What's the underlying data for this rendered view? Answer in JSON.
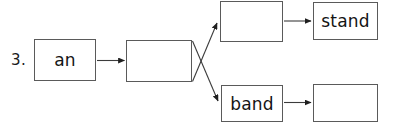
{
  "item": {
    "number_label": "3.",
    "type": "word-building-flow-diagram"
  },
  "boxes": [
    {
      "id": "box-an",
      "text": "an",
      "filled": true,
      "role": "base-word"
    },
    {
      "id": "box-root",
      "text": "",
      "filled": false,
      "role": "intermediate-blank"
    },
    {
      "id": "box-top1",
      "text": "",
      "filled": false,
      "role": "branch-top-blank"
    },
    {
      "id": "box-stand",
      "text": "stand",
      "filled": true,
      "role": "branch-top-result"
    },
    {
      "id": "box-band",
      "text": "band",
      "filled": true,
      "role": "branch-bottom-word"
    },
    {
      "id": "box-bot2",
      "text": "",
      "filled": false,
      "role": "branch-bottom-blank"
    }
  ],
  "connectors": [
    {
      "id": "arrow-an-to-root",
      "from": "box-an",
      "to": "box-root",
      "direction": "horizontal"
    },
    {
      "id": "arrow-root-to-top1",
      "from": "box-root",
      "to": "box-top1",
      "direction": "diagonal-up"
    },
    {
      "id": "arrow-root-to-band",
      "from": "box-root",
      "to": "box-band",
      "direction": "diagonal-down"
    },
    {
      "id": "arrow-top1-to-stand",
      "from": "box-top1",
      "to": "box-stand",
      "direction": "horizontal"
    },
    {
      "id": "arrow-band-to-bot2",
      "from": "box-band",
      "to": "box-bot2",
      "direction": "horizontal"
    }
  ],
  "colors": {
    "background": "#ffffff",
    "box_border": "#5a5a5a",
    "connector": "#3c3c3c",
    "text": "#141414"
  }
}
